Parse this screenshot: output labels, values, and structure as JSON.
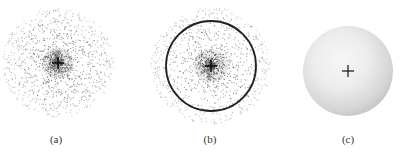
{
  "figure": {
    "panels": [
      {
        "id": "a",
        "label": "(a)",
        "description": "electron probability dot density",
        "center": [
          58,
          63
        ],
        "cloud_radius": 56,
        "dot_count": 1500,
        "has_boundary_circle": false,
        "label_pos": [
          56,
          134
        ]
      },
      {
        "id": "b",
        "label": "(b)",
        "description": "dot density with boundary surface circle",
        "center": [
          211,
          66
        ],
        "cloud_radius": 60,
        "dot_count": 1400,
        "has_boundary_circle": true,
        "boundary_radius": 45,
        "label_pos": [
          210,
          134
        ]
      },
      {
        "id": "c",
        "label": "(c)",
        "description": "shaded spherical boundary surface",
        "center": [
          348,
          71
        ],
        "sphere_radius": 45,
        "label_pos": [
          348,
          134
        ]
      }
    ],
    "colors": {
      "dot": "#444444",
      "nucleus_mark": "#111111",
      "boundary": "#222222",
      "sphere_light": "#f4f4f4",
      "sphere_dark": "#bdbdbd"
    }
  }
}
